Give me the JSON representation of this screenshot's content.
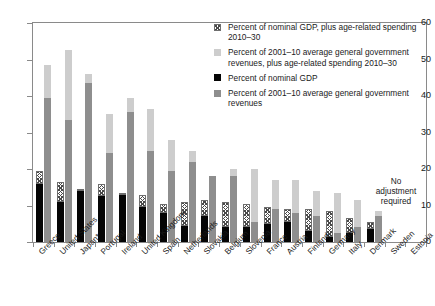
{
  "chart_data": {
    "type": "bar",
    "title": "",
    "subtitle": "",
    "xlabel": "",
    "ylabel": "",
    "ylim": [
      0,
      60
    ],
    "ytick_labels": [
      "0",
      "10",
      "20",
      "30",
      "40",
      "50",
      "60"
    ],
    "yticks": [
      0,
      10,
      20,
      30,
      40,
      50,
      60
    ],
    "grid": false,
    "legend_position": "top-right",
    "categories": [
      "Greece",
      "United States",
      "Japan*",
      "Portugal",
      "Ireland",
      "United Kingdom",
      "Spain",
      "Netherlands",
      "Slovakia",
      "Belgium",
      "Slovenia",
      "France",
      "Austria",
      "Finland",
      "Germany",
      "Italy",
      "Denmark",
      "Sweden",
      "Estonia"
    ],
    "series": [
      {
        "name": "Percent of nominal GDP",
        "key": "black",
        "color": "#050505",
        "values": [
          16.0,
          11.0,
          14.0,
          12.5,
          13.0,
          9.5,
          8.0,
          4.5,
          7.0,
          4.0,
          4.0,
          5.0,
          5.5,
          3.0,
          1.5,
          2.5,
          3.5,
          0,
          0
        ]
      },
      {
        "name": "Percent of nominal GDP, plus age-related spending 2010–30",
        "key": "hatch",
        "color": "#ffffff",
        "values": [
          19.5,
          16.5,
          14.5,
          16.0,
          13.5,
          13.0,
          10.5,
          11.0,
          11.5,
          11.0,
          10.5,
          9.5,
          9.0,
          9.0,
          8.5,
          6.5,
          5.5,
          0,
          0
        ]
      },
      {
        "name": "Percent of 2001–10 average general government revenues",
        "key": "darkgray",
        "color": "#8e8e8e",
        "values": [
          39.5,
          33.5,
          43.5,
          24.5,
          35.5,
          25.0,
          19.5,
          22.0,
          18.0,
          18.0,
          5.5,
          9.0,
          8.0,
          7.0,
          2.5,
          4.0,
          7.0,
          0,
          0
        ]
      },
      {
        "name": "Percent of 2001–10 average general government revenues, plus age-related spending 2010–30",
        "key": "lightgray",
        "color": "#cdcdcd",
        "values": [
          48.5,
          52.5,
          46.0,
          35.0,
          39.5,
          36.5,
          28.0,
          25.0,
          18.0,
          20.0,
          20.0,
          17.0,
          17.0,
          14.0,
          13.5,
          11.5,
          8.5,
          0,
          0
        ]
      }
    ],
    "annotations": [
      {
        "name": "no-adjustment-required",
        "text": "No\nadjustment\nrequired",
        "applies_to": [
          "Sweden",
          "Estonia"
        ]
      }
    ]
  },
  "legend": {
    "items": [
      {
        "swatch": "hatch",
        "label": "Percent of nominal GDP, plus age-related spending 2010–30"
      },
      {
        "swatch": "lightgray",
        "label": "Percent of 2001–10 average general government revenues, plus age-related spending 2010–30"
      },
      {
        "swatch": "black",
        "label": "Percent of nominal GDP"
      },
      {
        "swatch": "darkgray",
        "label": "Percent of 2001–10 average general government revenues"
      }
    ]
  },
  "annotation": {
    "line1": "No",
    "line2": "adjustment",
    "line3": "required"
  }
}
